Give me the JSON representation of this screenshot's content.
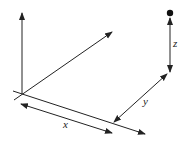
{
  "diagram": {
    "type": "3d-coordinate-axes",
    "labels": {
      "x": "x",
      "y": "y",
      "z": "z"
    },
    "colors": {
      "line": "#222222",
      "background": "#ffffff"
    }
  }
}
